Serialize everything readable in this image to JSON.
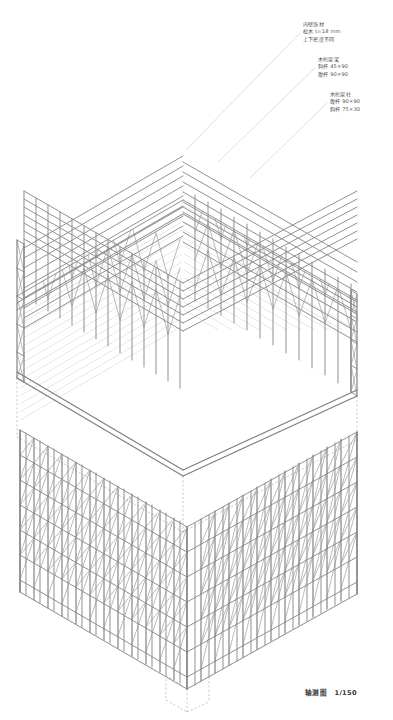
{
  "drawing": {
    "title_caption": "轴测图",
    "scale": "1/150",
    "type": "axonometric-exploded",
    "ink_color": "#8a8a8a",
    "hatch_color": "#b9b9b9",
    "dash_color": "#9a9a9a",
    "background": "#ffffff"
  },
  "annotations": [
    {
      "id": "interior-finish",
      "lines": [
        "内壁饰材",
        "松木 t=18 mm",
        "上下密度不同"
      ]
    },
    {
      "id": "timber-truss-beam",
      "lines": [
        "木桁架梁",
        "斜杆 45×90",
        "腹杆 90×90"
      ]
    },
    {
      "id": "timber-truss-column",
      "lines": [
        "木桁架柱",
        "腹杆 90×90",
        "斜杆 75×30"
      ]
    }
  ],
  "structure": {
    "upper": {
      "name": "roof-truss-grid",
      "bays_left": 13,
      "bays_right": 13,
      "truss_layers": 5
    },
    "lower": {
      "name": "lattice-column-wall",
      "bays_left": 12,
      "bays_right": 12,
      "tiers": 7
    }
  }
}
